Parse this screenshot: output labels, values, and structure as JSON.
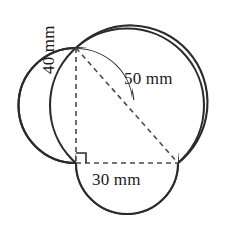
{
  "figure": {
    "units": "mm",
    "stroke_color": "#2b2b2b",
    "dash_color": "#4a4a4a",
    "text_color": "#1a1a1a",
    "background": "#ffffff",
    "labels": {
      "vertical_leg": "40 mm",
      "hypotenuse": "50 mm",
      "horizontal_leg": "30 mm"
    },
    "right_angle_marker": "right-angle",
    "triangle": {
      "vertices": {
        "top": [
          76,
          48
        ],
        "corner": [
          76,
          163
        ],
        "right": [
          178,
          163
        ]
      }
    },
    "circles": [
      {
        "name": "circle-on-vertical-leg",
        "cx": 76,
        "cy": 105.5,
        "r": 57.5,
        "diameter_label": "40 mm"
      },
      {
        "name": "circle-on-hypotenuse",
        "cx": 127,
        "cy": 105.5,
        "r": 77,
        "diameter_label": "50 mm"
      },
      {
        "name": "circle-on-horizontal-leg",
        "cx": 127,
        "cy": 163,
        "r": 51,
        "diameter_label": "30 mm"
      }
    ]
  }
}
